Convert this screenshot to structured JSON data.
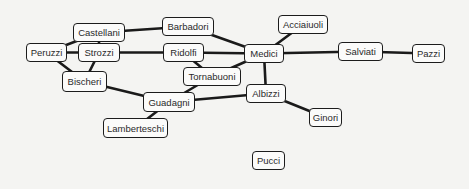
{
  "diagram": {
    "title": "",
    "nodes": [
      {
        "id": "castellani",
        "label": "Castellani",
        "x": 73,
        "y": 23,
        "w": 52,
        "h": 19
      },
      {
        "id": "barbadori",
        "label": "Barbadori",
        "x": 162,
        "y": 17,
        "w": 52,
        "h": 19
      },
      {
        "id": "acciaiuoli",
        "label": "Acciaiuoli",
        "x": 278,
        "y": 15,
        "w": 50,
        "h": 19
      },
      {
        "id": "peruzzi",
        "label": "Peruzzi",
        "x": 26,
        "y": 43,
        "w": 41,
        "h": 19
      },
      {
        "id": "strozzi",
        "label": "Strozzi",
        "x": 78,
        "y": 43,
        "w": 42,
        "h": 19
      },
      {
        "id": "ridolfi",
        "label": "Ridolfi",
        "x": 163,
        "y": 43,
        "w": 41,
        "h": 19
      },
      {
        "id": "medici",
        "label": "Medici",
        "x": 244,
        "y": 44,
        "w": 40,
        "h": 19
      },
      {
        "id": "salviati",
        "label": "Salviati",
        "x": 338,
        "y": 42,
        "w": 45,
        "h": 19
      },
      {
        "id": "pazzi",
        "label": "Pazzi",
        "x": 412,
        "y": 44,
        "w": 33,
        "h": 19
      },
      {
        "id": "tornabuoni",
        "label": "Tornabuoni",
        "x": 183,
        "y": 67,
        "w": 58,
        "h": 19
      },
      {
        "id": "bischeri",
        "label": "Bischeri",
        "x": 62,
        "y": 71,
        "w": 45,
        "h": 21
      },
      {
        "id": "albizzi",
        "label": "Albizzi",
        "x": 246,
        "y": 84,
        "w": 40,
        "h": 19
      },
      {
        "id": "guadagni",
        "label": "Guadagni",
        "x": 143,
        "y": 92,
        "w": 52,
        "h": 20
      },
      {
        "id": "ginori",
        "label": "Ginori",
        "x": 309,
        "y": 108,
        "w": 33,
        "h": 19
      },
      {
        "id": "lamberteschi",
        "label": "Lamberteschi",
        "x": 103,
        "y": 118,
        "w": 65,
        "h": 20
      },
      {
        "id": "pucci",
        "label": "Pucci",
        "x": 252,
        "y": 151,
        "w": 33,
        "h": 19
      }
    ],
    "edges": [
      [
        "castellani",
        "barbadori"
      ],
      [
        "castellani",
        "peruzzi"
      ],
      [
        "castellani",
        "strozzi"
      ],
      [
        "barbadori",
        "medici"
      ],
      [
        "acciaiuoli",
        "medici"
      ],
      [
        "peruzzi",
        "strozzi"
      ],
      [
        "peruzzi",
        "bischeri"
      ],
      [
        "strozzi",
        "bischeri"
      ],
      [
        "strozzi",
        "ridolfi"
      ],
      [
        "ridolfi",
        "medici"
      ],
      [
        "ridolfi",
        "tornabuoni"
      ],
      [
        "medici",
        "tornabuoni"
      ],
      [
        "medici",
        "salviati"
      ],
      [
        "medici",
        "albizzi"
      ],
      [
        "salviati",
        "pazzi"
      ],
      [
        "tornabuoni",
        "guadagni"
      ],
      [
        "bischeri",
        "guadagni"
      ],
      [
        "guadagni",
        "albizzi"
      ],
      [
        "guadagni",
        "lamberteschi"
      ],
      [
        "albizzi",
        "ginori"
      ]
    ],
    "colors": {
      "background": "#f4f4f2",
      "node_fill": "#fbfbfa",
      "node_border": "#1c1c1c",
      "edge": "#1a1a1a",
      "text": "#2a2a2a"
    }
  }
}
